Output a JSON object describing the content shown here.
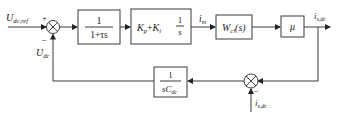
{
  "diagram": {
    "type": "control-block-diagram",
    "signals": {
      "reference": {
        "main": "U",
        "sub": "dc,ref"
      },
      "feedback_voltage": {
        "main": "U",
        "sub": "dc"
      },
      "current_cmd": {
        "main": "i",
        "sub": "m"
      },
      "output_current": {
        "main": "i",
        "sub": "s,dc"
      },
      "disturbance_current": {
        "main": "i",
        "sub": "s,dc"
      }
    },
    "signs": {
      "sum1_ref": "+",
      "sum1_fb": "–",
      "sum2_dist": "–"
    },
    "blocks": {
      "filter": {
        "num": "1",
        "den": "1+τs"
      },
      "pi": {
        "kp": "K",
        "kp_sub": "p",
        "plus": "+",
        "ki": "K",
        "ki_sub": "i",
        "frac_num": "1",
        "frac_den": "s"
      },
      "closed_loop": {
        "main": "W",
        "sub": "cl",
        "arg": "(s)"
      },
      "gain": {
        "label": "μ"
      },
      "capacitor": {
        "num": "1",
        "den_s": "s",
        "den_c": "C",
        "den_sub": "dc"
      }
    }
  }
}
